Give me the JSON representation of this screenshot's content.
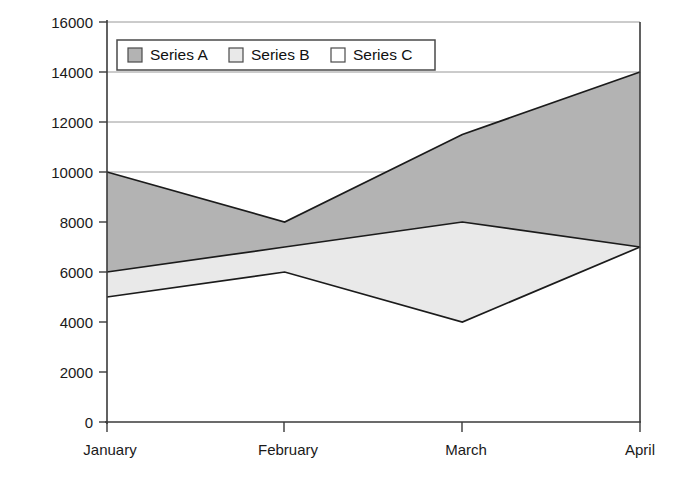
{
  "chart_data": {
    "type": "area",
    "stacked": true,
    "title": "",
    "subtitle": "",
    "xlabel": "",
    "ylabel": "",
    "categories": [
      "January",
      "February",
      "March",
      "April"
    ],
    "series": [
      {
        "name": "Series C",
        "values": [
          5000,
          6000,
          4000,
          7000
        ],
        "color": "#ffffff",
        "order": 1
      },
      {
        "name": "Series B",
        "values": [
          1000,
          1000,
          4000,
          0
        ],
        "color": "#e9e9e9",
        "order": 2
      },
      {
        "name": "Series A",
        "values": [
          4000,
          1000,
          3500,
          7000
        ],
        "color": "#b3b3b3",
        "order": 3
      }
    ],
    "cumulative_tops": {
      "Series C": [
        5000,
        6000,
        4000,
        7000
      ],
      "Series B": [
        6000,
        7000,
        8000,
        7000
      ],
      "Series A": [
        10000,
        8000,
        11500,
        14000
      ]
    },
    "ylim": [
      0,
      16000
    ],
    "yticks": [
      0,
      2000,
      4000,
      6000,
      8000,
      10000,
      12000,
      14000,
      16000
    ],
    "ytick_labels": [
      "0",
      "2000",
      "4000",
      "6000",
      "8000",
      "10000",
      "12000",
      "14000",
      "16000"
    ],
    "xtick_labels": [
      "January",
      "February",
      "March",
      "April"
    ],
    "grid": true,
    "grid_axis": "y",
    "legend": {
      "position": "top-left-inside",
      "entries": [
        {
          "label": "Series A",
          "swatch_color": "#b3b3b3"
        },
        {
          "label": "Series B",
          "swatch_color": "#e9e9e9"
        },
        {
          "label": "Series C",
          "swatch_color": "#ffffff"
        }
      ]
    },
    "colors": {
      "series_a": "#b3b3b3",
      "series_b": "#e9e9e9",
      "series_c": "#ffffff",
      "outline": "#1b1b1b",
      "grid": "#8d8d8d",
      "axis": "#3a3a3a",
      "background": "#ffffff",
      "text": "#111111"
    }
  }
}
